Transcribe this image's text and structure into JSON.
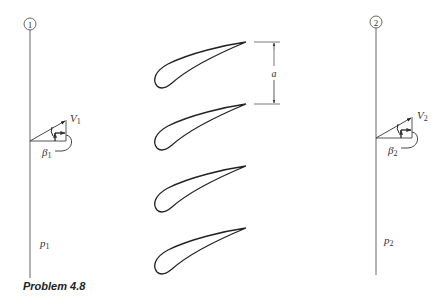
{
  "caption": "Problem 4.8",
  "stations": [
    {
      "id": "1",
      "marker": "1",
      "velocity_label": "V",
      "velocity_sub": "1",
      "angle_label": "β",
      "angle_sub": "1",
      "pressure_label": "p",
      "pressure_sub": "1"
    },
    {
      "id": "2",
      "marker": "2",
      "velocity_label": "V",
      "velocity_sub": "2",
      "angle_label": "β",
      "angle_sub": "2",
      "pressure_label": "p",
      "pressure_sub": "2"
    }
  ],
  "cascade": {
    "blade_count": 4,
    "spacing_label": "a"
  },
  "colors": {
    "line": "#555555",
    "blade": "#222222",
    "text": "#333333"
  }
}
